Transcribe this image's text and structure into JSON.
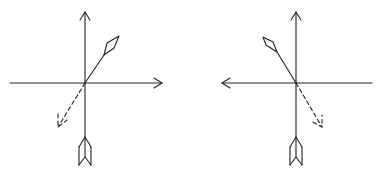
{
  "diagram": {
    "stroke_color": "#222222",
    "background": "#ffffff",
    "panels": [
      {
        "id": "left",
        "origin": [
          85,
          83
        ],
        "vertical_axis": {
          "top": [
            85,
            12
          ],
          "bottom": [
            85,
            150
          ],
          "arrowhead": "up"
        },
        "horizontal_axis": {
          "left": [
            10,
            83
          ],
          "right": [
            162,
            83
          ],
          "arrowhead": "right"
        },
        "solid_vector": {
          "end": [
            119,
            36
          ],
          "tail_marker": "diamond"
        },
        "dashed_vector": {
          "end": [
            58,
            127
          ],
          "arrowhead": "open"
        },
        "fletching": {
          "x": 85,
          "top": 136,
          "bottom": 165
        }
      },
      {
        "id": "right",
        "origin": [
          296,
          83
        ],
        "vertical_axis": {
          "top": [
            296,
            12
          ],
          "bottom": [
            296,
            150
          ],
          "arrowhead": "up"
        },
        "horizontal_axis": {
          "left": [
            222,
            83
          ],
          "right": [
            372,
            83
          ],
          "arrowhead": "left"
        },
        "solid_vector": {
          "end": [
            263,
            37
          ],
          "tail_marker": "diamond"
        },
        "dashed_vector": {
          "end": [
            322,
            127
          ],
          "arrowhead": "open"
        },
        "fletching": {
          "x": 296,
          "top": 136,
          "bottom": 165
        }
      }
    ]
  }
}
